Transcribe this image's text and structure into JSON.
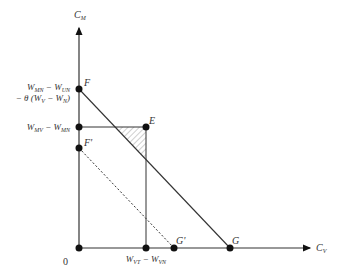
{
  "diagram": {
    "axes": {
      "y_label": "C",
      "y_label_sub": "M",
      "x_label": "C",
      "x_label_sub": "V",
      "origin_label": "0"
    },
    "points": {
      "F": "F",
      "F_prime": "F'",
      "E": "E",
      "G": "G",
      "G_prime": "G'"
    },
    "y_ticks": {
      "F_line1": "W",
      "F_line1_sub_a": "MN",
      "F_line1_mid": " − W",
      "F_line1_sub_b": "UN",
      "F_line2": "− θ (W",
      "F_line2_sub_a": "V",
      "F_line2_mid": " − W",
      "F_line2_sub_b": "N",
      "F_line2_end": ")",
      "E_level": "W",
      "E_level_sub_a": "MV",
      "E_level_mid": " − W",
      "E_level_sub_b": "MN"
    },
    "x_ticks": {
      "E_level": "W",
      "E_level_sub_a": "VT",
      "E_level_mid": " − W",
      "E_level_sub_b": "VN"
    },
    "colors": {
      "line": "#333333",
      "point": "#111111",
      "hatch": "#888888"
    }
  }
}
